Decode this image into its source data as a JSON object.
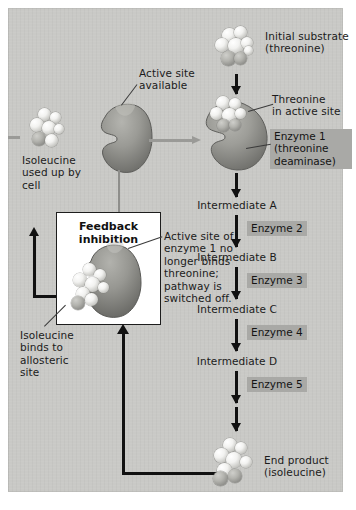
{
  "figure": {
    "background_color": "#c9c9c6",
    "chip_color": "#a9a9a6",
    "arrow_color": "#111111",
    "gray_arrow_color": "#9a9a97"
  },
  "labels": {
    "initial_substrate": "Initial substrate\n(threonine)",
    "threonine_in_active_site": "Threonine\nin active site",
    "active_site_available": "Active site\navailable",
    "isoleucine_used_up": "Isoleucine\nused up by\ncell",
    "isoleucine_binds": "Isoleucine\nbinds to\nallosteric\nsite",
    "active_site_blocked": "Active site of\nenzyme 1 no\nlonger binds\nthreonine;\npathway is\nswitched off.",
    "feedback_inhibition": "Feedback\ninhibition",
    "end_product": "End product\n(isoleucine)"
  },
  "pathway": {
    "steps": [
      {
        "substrate": "Initial substrate\n(threonine)",
        "enzyme": "Enzyme 1\n(threonine\ndeaminase)"
      },
      {
        "substrate": "Intermediate A",
        "enzyme": "Enzyme 2"
      },
      {
        "substrate": "Intermediate B",
        "enzyme": "Enzyme 3"
      },
      {
        "substrate": "Intermediate C",
        "enzyme": "Enzyme 4"
      },
      {
        "substrate": "Intermediate D",
        "enzyme": "Enzyme 5"
      },
      {
        "substrate": "End product\n(isoleucine)",
        "enzyme": ""
      }
    ],
    "intermediate_a": "Intermediate A",
    "intermediate_b": "Intermediate B",
    "intermediate_c": "Intermediate C",
    "intermediate_d": "Intermediate D",
    "enzyme_1": "Enzyme 1\n(threonine\ndeaminase)",
    "enzyme_2": "Enzyme 2",
    "enzyme_3": "Enzyme 3",
    "enzyme_4": "Enzyme 4",
    "enzyme_5": "Enzyme 5"
  }
}
